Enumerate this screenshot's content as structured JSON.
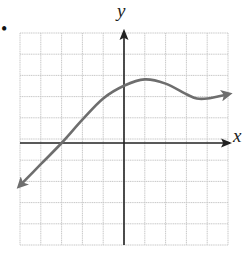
{
  "figure": {
    "bullet": "•",
    "x_axis_label": "x",
    "y_axis_label": "y"
  },
  "colors": {
    "grid": "#c8c8c8",
    "axis": "#222222",
    "curve": "#6e6e6e"
  },
  "chart_data": {
    "type": "line",
    "title": "",
    "xlabel": "x",
    "ylabel": "y",
    "xlim": [
      -5,
      5
    ],
    "ylim": [
      -5,
      5
    ],
    "grid": true,
    "grid_step": 1,
    "legend": null,
    "tick_labels": false,
    "series": [
      {
        "name": "f(x)",
        "arrow_start": true,
        "arrow_end": true,
        "x": [
          -5,
          -4,
          -3,
          -2,
          -1,
          0,
          1,
          2,
          3,
          3.5,
          4,
          5
        ],
        "y": [
          -2,
          -1,
          0,
          1.1,
          2.1,
          2.7,
          3.0,
          2.8,
          2.3,
          2.1,
          2.1,
          2.3
        ]
      }
    ]
  }
}
